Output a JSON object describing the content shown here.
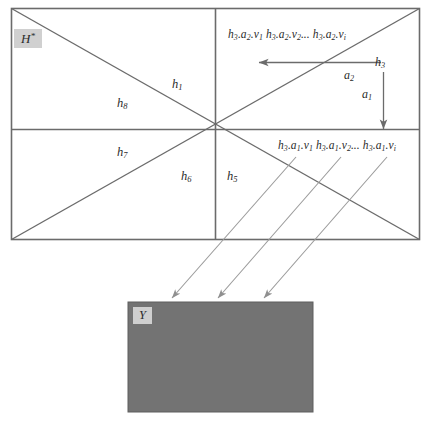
{
  "figure": {
    "main_rect": {
      "label": "H",
      "label_sup": "*",
      "label_full": "H*"
    },
    "output_rect": {
      "label": "Y",
      "fill_color": "#737373",
      "label_box_color": "#cfcfcf"
    },
    "stroke_color": "#6b6b6b",
    "thin_stroke_color": "#9a9a9a",
    "text_color": "#2b2b2b",
    "background_color": "#ffffff"
  },
  "region_labels": [
    {
      "id": "h1",
      "base": "h",
      "sub": "1",
      "text": "h1"
    },
    {
      "id": "h8",
      "base": "h",
      "sub": "8",
      "text": "h8"
    },
    {
      "id": "h7",
      "base": "h",
      "sub": "7",
      "text": "h7"
    },
    {
      "id": "h6",
      "base": "h",
      "sub": "6",
      "text": "h6"
    },
    {
      "id": "h5",
      "base": "h",
      "sub": "5",
      "text": "h5"
    }
  ],
  "arrow_labels": [
    {
      "id": "h3",
      "base": "h",
      "sub": "3",
      "text": "h3"
    },
    {
      "id": "a2",
      "base": "a",
      "sub": "2",
      "text": "a2"
    },
    {
      "id": "a1",
      "base": "a",
      "sub": "1",
      "text": "a1"
    }
  ],
  "sequences": {
    "upper": {
      "items": [
        {
          "base": "h",
          "sub": "3",
          "mid": "a",
          "midsub": "2",
          "last": "v",
          "lastsub": "1"
        },
        {
          "base": "h",
          "sub": "3",
          "mid": "a",
          "midsub": "2",
          "last": "v",
          "lastsub": "2"
        },
        {
          "base": "h",
          "sub": "3",
          "mid": "a",
          "midsub": "2",
          "last": "v",
          "lastsub": "i"
        }
      ],
      "ellipsis": "...",
      "plain": "h3.a2.v1 h3.a2.v2 ... h3.a2.vi"
    },
    "lower": {
      "items": [
        {
          "base": "h",
          "sub": "3",
          "mid": "a",
          "midsub": "1",
          "last": "v",
          "lastsub": "1"
        },
        {
          "base": "h",
          "sub": "3",
          "mid": "a",
          "midsub": "1",
          "last": "v",
          "lastsub": "2"
        },
        {
          "base": "h",
          "sub": "3",
          "mid": "a",
          "midsub": "1",
          "last": "v",
          "lastsub": "i"
        }
      ],
      "ellipsis": "...",
      "plain": "h3.a1.v1 h3.a1.v2 ... h3.a1.vi"
    }
  }
}
